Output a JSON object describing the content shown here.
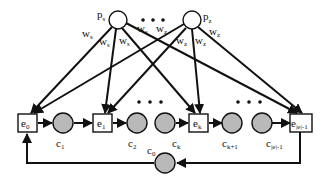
{
  "diagram": {
    "input_nodes": [
      {
        "id": "p_s",
        "label": "p",
        "sub": "s"
      },
      {
        "id": "p_z",
        "label": "p",
        "sub": "z"
      }
    ],
    "weights": {
      "p_s": [
        {
          "label": "w",
          "sub": "s"
        },
        {
          "label": "w",
          "sub": "s"
        },
        {
          "label": "w",
          "sub": "s"
        },
        {
          "label": "w",
          "sub": "s"
        }
      ],
      "p_z": [
        {
          "label": "w",
          "sub": "z"
        },
        {
          "label": "w",
          "sub": "z"
        },
        {
          "label": "w",
          "sub": "z"
        },
        {
          "label": "w",
          "sub": "z"
        }
      ]
    },
    "box_nodes": [
      {
        "id": "e_0",
        "label": "e",
        "sub": "0"
      },
      {
        "id": "e_1",
        "label": "e",
        "sub": "1"
      },
      {
        "id": "e_k",
        "label": "e",
        "sub": "k"
      },
      {
        "id": "e_last",
        "label": "e",
        "sub": "|e|-1"
      }
    ],
    "chain_circles": [
      {
        "id": "c_1",
        "label": "c",
        "sub": "1"
      },
      {
        "id": "c_2",
        "label": "c",
        "sub": "2"
      },
      {
        "id": "c_k",
        "label": "c",
        "sub": "k"
      },
      {
        "id": "c_k1",
        "label": "c",
        "sub": "k+1"
      },
      {
        "id": "c_last",
        "label": "c",
        "sub": "|e|-1"
      }
    ],
    "feedback_circle": {
      "id": "c_0",
      "label": "c",
      "sub": "0"
    },
    "ellipsis": "• • •"
  }
}
